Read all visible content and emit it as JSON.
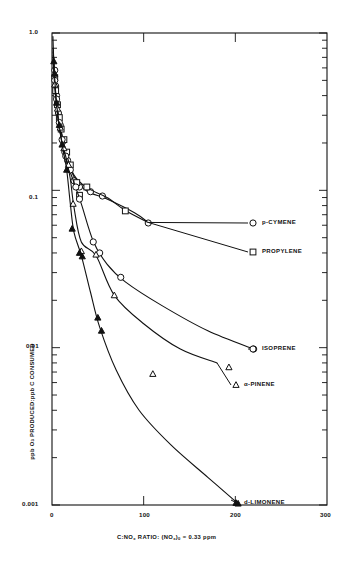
{
  "figure": {
    "background": "#ffffff",
    "ink": "#111111"
  },
  "axes": {
    "x": {
      "label_parts": {
        "pre": "C:NO",
        "sub1": "x",
        "mid": " RATIO: (NO",
        "sub2": "x",
        "post": ")",
        "sub3": "0",
        "tail": " = 0.33 ppm"
      },
      "label_plain": "C:NOx RATIO: (NOx)0 = 0.33 ppm",
      "scale": "linear",
      "min": 0,
      "max": 300,
      "major_ticks": [
        0,
        100,
        200,
        300
      ],
      "tick_labels": [
        "0",
        "100",
        "200",
        "300"
      ]
    },
    "y": {
      "label_parts": {
        "pre": "ppb O",
        "sub1": "3",
        "post": " PRODUCED:ppb C CONSUMED"
      },
      "label_plain": "ppb O3 PRODUCED:ppb C CONSUMED",
      "scale": "log",
      "min": 0.001,
      "max": 1.0,
      "major_ticks": [
        1.0,
        0.1,
        0.01,
        0.001
      ],
      "tick_labels": [
        "1.0",
        "0.1",
        "0.01",
        "0.001"
      ]
    }
  },
  "legend": {
    "position": "right-inside",
    "entries": [
      {
        "label": "p-CYMENE",
        "marker": "circle-open",
        "x": 253,
        "y": 223
      },
      {
        "label": "PROPYLENE",
        "marker": "square-open",
        "x": 253,
        "y": 252
      },
      {
        "label": "ISOPRENE",
        "marker": "circle-open",
        "x": 253,
        "y": 349
      },
      {
        "label": "α-PINENE",
        "marker": "triangle-open",
        "x": 236,
        "y": 385
      },
      {
        "label": "d-LIMONENE",
        "marker": "triangle-filled",
        "x": 236,
        "y": 503
      }
    ]
  },
  "chart_data": {
    "type": "scatter",
    "title": "",
    "subtitle": "",
    "xlabel": "C:NOx RATIO: (NOx)0 = 0.33 ppm",
    "ylabel": "ppb O3 PRODUCED:ppb C CONSUMED",
    "xlim": [
      0,
      300
    ],
    "ylim": [
      0.001,
      1.0
    ],
    "yscale": "log",
    "xscale": "linear",
    "grid": false,
    "legend_position": "right-inside",
    "series": [
      {
        "name": "p-CYMENE",
        "marker": "circle-open",
        "points": [
          {
            "x": 3,
            "y": 0.58
          },
          {
            "x": 4,
            "y": 0.46
          },
          {
            "x": 5,
            "y": 0.4
          },
          {
            "x": 7,
            "y": 0.31
          },
          {
            "x": 9,
            "y": 0.26
          },
          {
            "x": 12,
            "y": 0.205
          },
          {
            "x": 14,
            "y": 0.175
          },
          {
            "x": 17,
            "y": 0.155
          },
          {
            "x": 24,
            "y": 0.115
          },
          {
            "x": 30,
            "y": 0.105
          },
          {
            "x": 42,
            "y": 0.098
          },
          {
            "x": 55,
            "y": 0.092
          },
          {
            "x": 105,
            "y": 0.062
          }
        ]
      },
      {
        "name": "PROPYLENE",
        "marker": "square-open",
        "points": [
          {
            "x": 3,
            "y": 0.52
          },
          {
            "x": 4,
            "y": 0.43
          },
          {
            "x": 6,
            "y": 0.35
          },
          {
            "x": 8,
            "y": 0.29
          },
          {
            "x": 10,
            "y": 0.245
          },
          {
            "x": 13,
            "y": 0.21
          },
          {
            "x": 16,
            "y": 0.175
          },
          {
            "x": 20,
            "y": 0.145
          },
          {
            "x": 27,
            "y": 0.112
          },
          {
            "x": 30,
            "y": 0.093
          },
          {
            "x": 38,
            "y": 0.105
          },
          {
            "x": 80,
            "y": 0.074
          }
        ]
      },
      {
        "name": "ISOPRENE",
        "marker": "circle-open",
        "points": [
          {
            "x": 3,
            "y": 0.5
          },
          {
            "x": 5,
            "y": 0.38
          },
          {
            "x": 8,
            "y": 0.27
          },
          {
            "x": 11,
            "y": 0.21
          },
          {
            "x": 15,
            "y": 0.165
          },
          {
            "x": 20,
            "y": 0.135
          },
          {
            "x": 26,
            "y": 0.105
          },
          {
            "x": 30,
            "y": 0.088
          },
          {
            "x": 45,
            "y": 0.047
          },
          {
            "x": 52,
            "y": 0.04
          },
          {
            "x": 75,
            "y": 0.028
          },
          {
            "x": 220,
            "y": 0.0098
          }
        ]
      },
      {
        "name": "α-PINENE",
        "marker": "triangle-open",
        "points": [
          {
            "x": 3,
            "y": 0.47
          },
          {
            "x": 6,
            "y": 0.33
          },
          {
            "x": 9,
            "y": 0.25
          },
          {
            "x": 13,
            "y": 0.185
          },
          {
            "x": 18,
            "y": 0.145
          },
          {
            "x": 23,
            "y": 0.082
          },
          {
            "x": 32,
            "y": 0.041
          },
          {
            "x": 48,
            "y": 0.039
          },
          {
            "x": 68,
            "y": 0.0215
          },
          {
            "x": 110,
            "y": 0.0068
          },
          {
            "x": 193,
            "y": 0.0075
          }
        ]
      },
      {
        "name": "d-LIMONENE",
        "marker": "triangle-filled",
        "points": [
          {
            "x": 2,
            "y": 0.66
          },
          {
            "x": 3,
            "y": 0.55
          },
          {
            "x": 5,
            "y": 0.36
          },
          {
            "x": 8,
            "y": 0.26
          },
          {
            "x": 11,
            "y": 0.195
          },
          {
            "x": 16,
            "y": 0.135
          },
          {
            "x": 22,
            "y": 0.057
          },
          {
            "x": 30,
            "y": 0.04
          },
          {
            "x": 33,
            "y": 0.038
          },
          {
            "x": 50,
            "y": 0.0155
          },
          {
            "x": 54,
            "y": 0.0128
          },
          {
            "x": 203,
            "y": 0.00102
          }
        ]
      }
    ]
  }
}
